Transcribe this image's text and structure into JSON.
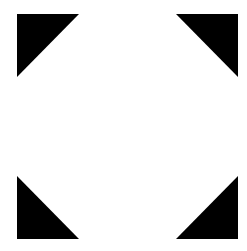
{
  "icon": {
    "name": "fullscreen-expand-icon",
    "label": "Expand to fullscreen",
    "background": "#ffffff",
    "fill": "#000000",
    "corners": [
      {
        "id": "top-left",
        "points": "17,14 79,14 17,77"
      },
      {
        "id": "top-right",
        "points": "176,14 238,14 238,77"
      },
      {
        "id": "bottom-left",
        "points": "17,176 17,239 79,239"
      },
      {
        "id": "bottom-right",
        "points": "238,176 238,239 176,239"
      }
    ]
  }
}
